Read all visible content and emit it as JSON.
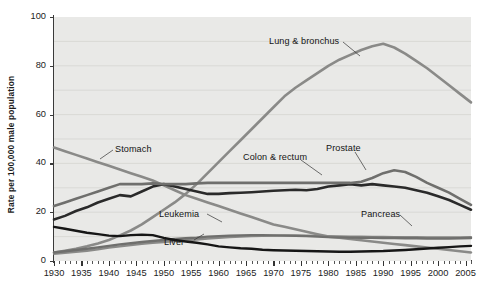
{
  "figure": {
    "ylabel": "Rate per 100,000 male population",
    "background": "#ffffff",
    "plot_background": "#e9e9e7"
  },
  "axis": {
    "y_ticks": [
      "0",
      "20",
      "40",
      "60",
      "80",
      "100"
    ],
    "x_ticks": [
      "1930",
      "1935",
      "1940",
      "1945",
      "1950",
      "1955",
      "1960",
      "1965",
      "1970",
      "1975",
      "1980",
      "1985",
      "1990",
      "1995",
      "2000",
      "2005"
    ]
  },
  "annotations": [
    {
      "label": "Lung & bronchus"
    },
    {
      "label": "Stomach"
    },
    {
      "label": "Colon & rectum"
    },
    {
      "label": "Prostate"
    },
    {
      "label": "Leukemia"
    },
    {
      "label": "Pancreas"
    },
    {
      "label": "Liver"
    }
  ],
  "chart_data": {
    "type": "line",
    "title": "",
    "xlabel": "",
    "ylabel": "Rate per 100,000 male population",
    "xlim": [
      1930,
      2006
    ],
    "ylim": [
      0,
      100
    ],
    "grid": true,
    "legend_position": "inline-annotations",
    "x": [
      1930,
      1932,
      1934,
      1936,
      1938,
      1940,
      1942,
      1944,
      1946,
      1948,
      1950,
      1952,
      1954,
      1956,
      1958,
      1960,
      1962,
      1964,
      1966,
      1968,
      1970,
      1972,
      1974,
      1976,
      1978,
      1980,
      1982,
      1984,
      1986,
      1988,
      1990,
      1992,
      1994,
      1996,
      1998,
      2000,
      2002,
      2004,
      2006
    ],
    "series": [
      {
        "name": "Lung & bronchus",
        "color": "#8a8a88",
        "width": 2.6,
        "values": [
          3.5,
          4.2,
          5.0,
          6.0,
          7.2,
          8.6,
          10.5,
          12.5,
          15.0,
          18.0,
          21.0,
          24.0,
          27.5,
          31.5,
          36.0,
          40.5,
          45.0,
          49.5,
          54.0,
          58.5,
          63.0,
          67.5,
          71.0,
          74.0,
          77.0,
          80.0,
          82.5,
          84.5,
          86.5,
          88.0,
          89.0,
          87.5,
          85.0,
          82.0,
          79.0,
          75.5,
          72.0,
          68.5,
          65.0
        ]
      },
      {
        "name": "Stomach",
        "color": "#8a8a88",
        "width": 2.6,
        "values": [
          46.5,
          45.0,
          43.5,
          42.0,
          40.5,
          39.0,
          37.5,
          36.0,
          34.5,
          33.0,
          31.0,
          29.0,
          27.0,
          25.5,
          24.0,
          22.5,
          21.0,
          19.5,
          18.0,
          16.5,
          15.0,
          14.0,
          13.0,
          12.0,
          11.0,
          10.0,
          9.5,
          9.0,
          8.5,
          8.0,
          7.5,
          7.0,
          6.5,
          6.0,
          5.5,
          5.0,
          4.5,
          4.0,
          3.5
        ]
      },
      {
        "name": "Colon & rectum",
        "color": "#2a2a2a",
        "width": 2.6,
        "values": [
          17.0,
          18.5,
          20.5,
          22.0,
          24.0,
          25.5,
          27.0,
          26.5,
          28.5,
          30.5,
          31.5,
          30.5,
          29.5,
          28.5,
          27.5,
          27.5,
          27.8,
          28.0,
          28.2,
          28.5,
          28.8,
          29.0,
          29.2,
          29.0,
          29.5,
          30.5,
          31.0,
          31.5,
          31.0,
          31.5,
          31.0,
          30.5,
          30.0,
          29.0,
          28.0,
          26.5,
          25.0,
          23.0,
          21.0
        ]
      },
      {
        "name": "Prostate",
        "color": "#6f6f6d",
        "width": 2.6,
        "values": [
          22.5,
          24.0,
          25.5,
          27.0,
          28.5,
          30.0,
          31.5,
          31.5,
          31.5,
          31.8,
          31.5,
          31.5,
          31.5,
          31.8,
          32.0,
          32.0,
          32.0,
          32.0,
          32.0,
          32.0,
          32.0,
          32.0,
          32.0,
          32.0,
          32.0,
          32.0,
          32.0,
          32.0,
          32.5,
          34.0,
          36.0,
          37.2,
          36.5,
          34.5,
          32.0,
          30.0,
          28.0,
          25.5,
          23.0
        ]
      },
      {
        "name": "Leukemia",
        "color": "#8a8a88",
        "width": 2.4,
        "values": [
          3.0,
          3.4,
          3.8,
          4.2,
          4.8,
          5.5,
          6.0,
          6.5,
          7.0,
          7.5,
          7.8,
          8.2,
          8.5,
          8.8,
          9.2,
          9.5,
          9.8,
          10.0,
          10.2,
          10.3,
          10.4,
          10.5,
          10.5,
          10.4,
          10.3,
          10.2,
          10.1,
          10.0,
          10.0,
          9.9,
          9.9,
          9.8,
          9.8,
          9.8,
          9.7,
          9.7,
          9.7,
          9.7,
          9.8
        ]
      },
      {
        "name": "Pancreas",
        "color": "#6f6f6d",
        "width": 2.4,
        "values": [
          3.5,
          4.0,
          4.5,
          5.0,
          5.6,
          6.2,
          6.8,
          7.3,
          7.8,
          8.2,
          8.6,
          9.0,
          9.3,
          9.6,
          10.0,
          10.2,
          10.4,
          10.5,
          10.6,
          10.6,
          10.5,
          10.4,
          10.3,
          10.2,
          10.0,
          9.8,
          9.7,
          9.6,
          9.5,
          9.5,
          9.4,
          9.4,
          9.3,
          9.3,
          9.2,
          9.2,
          9.2,
          9.3,
          9.4
        ]
      },
      {
        "name": "Liver",
        "color": "#161616",
        "width": 2.4,
        "values": [
          14.0,
          13.2,
          12.4,
          11.6,
          11.0,
          10.4,
          10.2,
          10.6,
          10.8,
          10.6,
          9.5,
          8.6,
          8.0,
          7.5,
          6.8,
          6.0,
          5.6,
          5.2,
          5.0,
          4.6,
          4.4,
          4.3,
          4.2,
          4.1,
          4.0,
          3.9,
          3.8,
          3.8,
          3.9,
          4.0,
          4.1,
          4.3,
          4.5,
          4.8,
          5.1,
          5.4,
          5.7,
          6.0,
          6.2
        ]
      }
    ]
  }
}
